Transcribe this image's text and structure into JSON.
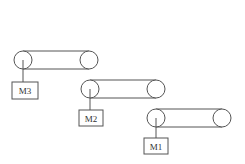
{
  "diagram": {
    "stroke_color": "#555555",
    "conveyors": [
      {
        "id": "c3",
        "motor_label": "M3",
        "left": {
          "cx": 23,
          "cy": 60
        },
        "right": {
          "cx": 89,
          "cy": 60
        },
        "r": 9,
        "box": {
          "x": 12,
          "y": 82,
          "w": 26,
          "h": 17
        }
      },
      {
        "id": "c2",
        "motor_label": "M2",
        "left": {
          "cx": 90,
          "cy": 89
        },
        "right": {
          "cx": 156,
          "cy": 89
        },
        "r": 9,
        "box": {
          "x": 79,
          "y": 110,
          "w": 24,
          "h": 16
        }
      },
      {
        "id": "c1",
        "motor_label": "M1",
        "left": {
          "cx": 156,
          "cy": 118
        },
        "right": {
          "cx": 222,
          "cy": 118
        },
        "r": 9,
        "box": {
          "x": 144,
          "y": 138,
          "w": 24,
          "h": 16
        }
      }
    ]
  }
}
